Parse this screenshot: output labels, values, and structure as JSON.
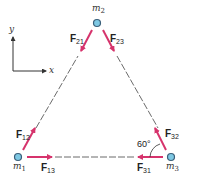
{
  "diagram": {
    "colors": {
      "force_arrow": "#d6336c",
      "line": "#444444",
      "mass_fill": "#7ec8e3",
      "mass_stroke": "#3a5f7a"
    },
    "axes": {
      "x_label": "x",
      "y_label": "y"
    },
    "masses": [
      {
        "id": "m1",
        "base": "m",
        "sub": "1"
      },
      {
        "id": "m2",
        "base": "m",
        "sub": "2"
      },
      {
        "id": "m3",
        "base": "m",
        "sub": "3"
      }
    ],
    "forces": [
      {
        "id": "F21",
        "base": "F",
        "sub": "21"
      },
      {
        "id": "F23",
        "base": "F",
        "sub": "23"
      },
      {
        "id": "F12",
        "base": "F",
        "sub": "12"
      },
      {
        "id": "F13",
        "base": "F",
        "sub": "13"
      },
      {
        "id": "F32",
        "base": "F",
        "sub": "32"
      },
      {
        "id": "F31",
        "base": "F",
        "sub": "31"
      }
    ],
    "angle_label": "60°"
  }
}
